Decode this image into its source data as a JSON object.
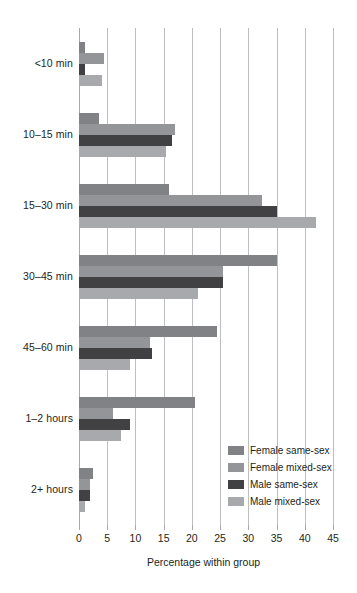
{
  "chart_data": {
    "type": "bar",
    "orientation": "horizontal",
    "title": "",
    "subtitle": "",
    "xlabel": "Percentage within group",
    "ylabel": "",
    "xlim": [
      0,
      45
    ],
    "xticks": [
      0,
      5,
      10,
      15,
      20,
      25,
      30,
      35,
      40,
      45
    ],
    "xtick_labels": [
      "0",
      "5",
      "10",
      "15",
      "20",
      "25",
      "30",
      "35",
      "40",
      "45"
    ],
    "grid": true,
    "grid_axis": "x",
    "legend_position": "inside-lower-right",
    "categories": [
      "<10 min",
      "10–15 min",
      "15–30 min",
      "30–45 min",
      "45–60 min",
      "1–2 hours",
      "2+ hours"
    ],
    "series": [
      {
        "name": "Female same-sex",
        "color": "#808285",
        "values": [
          1.0,
          3.5,
          16.0,
          35.0,
          24.5,
          20.5,
          2.5
        ]
      },
      {
        "name": "Female mixed-sex",
        "color": "#939598",
        "values": [
          4.5,
          17.0,
          32.5,
          25.5,
          12.5,
          6.0,
          2.0
        ]
      },
      {
        "name": "Male same-sex",
        "color": "#414042",
        "values": [
          1.0,
          16.5,
          35.0,
          25.5,
          13.0,
          9.0,
          2.0
        ]
      },
      {
        "name": "Male mixed-sex",
        "color": "#a7a9ac",
        "values": [
          4.0,
          15.5,
          42.0,
          21.0,
          9.0,
          7.5,
          1.0
        ]
      }
    ]
  },
  "legend": {
    "items": [
      {
        "label": "Female same-sex",
        "color": "#808285"
      },
      {
        "label": "Female mixed-sex",
        "color": "#939598"
      },
      {
        "label": "Male same-sex",
        "color": "#414042"
      },
      {
        "label": "Male mixed-sex",
        "color": "#a7a9ac"
      }
    ]
  },
  "axis": {
    "x_title": "Percentage within group"
  }
}
